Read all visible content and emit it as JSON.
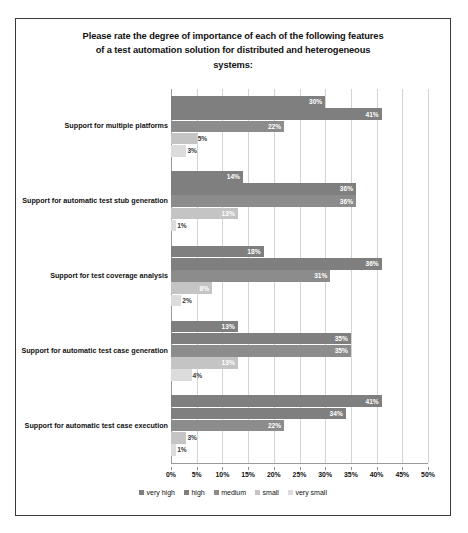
{
  "chart_data": {
    "type": "bar",
    "orientation": "horizontal",
    "title_lines": [
      "Please rate the degree of importance of each of the following features",
      "of a test automation solution for distributed and heterogeneous",
      "systems:"
    ],
    "xlabel": "",
    "ylabel": "",
    "xlim": [
      0,
      50
    ],
    "grid": true,
    "legend_position": "bottom",
    "categories": [
      "Support for multiple platforms",
      "Support for automatic test stub generation",
      "Support for test coverage analysis",
      "Support for automatic test case generation",
      "Support for automatic test case execution"
    ],
    "tick_labels": [
      "0%",
      "5%",
      "10%",
      "15%",
      "20%",
      "25%",
      "30%",
      "35%",
      "40%",
      "45%",
      "50%"
    ],
    "tick_values": [
      0,
      5,
      10,
      15,
      20,
      25,
      30,
      35,
      40,
      45,
      50
    ],
    "series": [
      {
        "name": "very high",
        "color": "#7f7f7f",
        "values": [
          30,
          14,
          18,
          13,
          41
        ],
        "labels": [
          "30%",
          "14%",
          "18%",
          "13%",
          "41%"
        ]
      },
      {
        "name": "high",
        "color": "#7f7f7f",
        "values": [
          41,
          36,
          41,
          35,
          34
        ],
        "labels": [
          "41%",
          "36%",
          "36%",
          "35%",
          "34%"
        ]
      },
      {
        "name": "medium",
        "color": "#8c8c8c",
        "values": [
          22,
          36,
          31,
          35,
          22
        ],
        "labels": [
          "22%",
          "36%",
          "31%",
          "35%",
          "22%"
        ]
      },
      {
        "name": "small",
        "color": "#c4c4c4",
        "values": [
          5,
          13,
          8,
          13,
          3
        ],
        "labels": [
          "5%",
          "13%",
          "8%",
          "13%",
          "3%"
        ]
      },
      {
        "name": "very small",
        "color": "#dcdcdc",
        "values": [
          3,
          1,
          2,
          4,
          1
        ],
        "labels": [
          "3%",
          "1%",
          "2%",
          "4%",
          "1%"
        ]
      }
    ]
  }
}
